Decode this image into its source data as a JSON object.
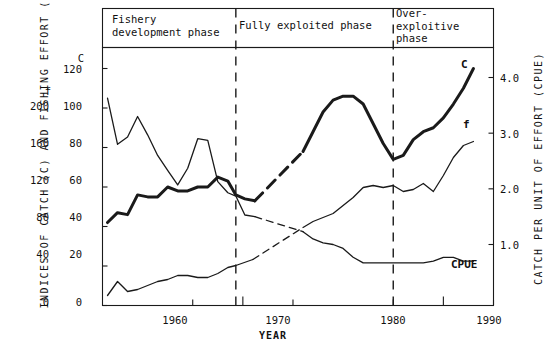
{
  "figure": {
    "y_axis_left_title": "INDICES OF CATCH (C) AND FISHING EFFORT (f)",
    "y_axis_right_title": "CATCH PER UNIT OF EFFORT (CPUE)",
    "x_axis_title": "YEAR"
  },
  "phases": [
    {
      "id": "phase-development",
      "label": "Fishery\ndevelopment phase"
    },
    {
      "id": "phase-fully-exploited",
      "label": "Fully exploited phase"
    },
    {
      "id": "phase-over-exploitive",
      "label": "Over-\nexploitive\nphase"
    }
  ],
  "axis_headers": {
    "c_header": "C",
    "f_header": "f"
  },
  "ticks": {
    "c_scale": [
      "120",
      "100",
      "80",
      "60",
      "40",
      "20",
      "0"
    ],
    "f_scale": [
      "200",
      "160",
      "120",
      "80",
      "40",
      "0"
    ],
    "cpue_scale": [
      "4.0",
      "3.0",
      "2.0",
      "1.0"
    ],
    "years": [
      "1960",
      "1970",
      "1980",
      "1990"
    ]
  },
  "series_keys": {
    "catch": "C",
    "effort": "f",
    "cpue": "CPUE"
  },
  "chart_data": {
    "type": "line",
    "title": "",
    "subtitle": "",
    "xlabel": "YEAR",
    "ylabel": "INDICES OF CATCH (C) AND FISHING EFFORT (f)",
    "ylabel_right": "CATCH PER UNIT OF EFFORT (CPUE)",
    "xlim": [
      1951,
      1990
    ],
    "ylim_c": [
      0,
      130
    ],
    "ylim_f": [
      0,
      216
    ],
    "ylim_cpue": [
      0,
      4.33
    ],
    "grid": false,
    "legend": "inline-end-labels",
    "phase_dividers": [
      1964.3,
      1980
    ],
    "annotations": [
      {
        "text": "Fishery development phase",
        "x_range": [
          1951,
          1964.3
        ]
      },
      {
        "text": "Fully exploited phase",
        "x_range": [
          1964.3,
          1980
        ]
      },
      {
        "text": "Over-exploitive phase",
        "x_range": [
          1980,
          1990
        ]
      }
    ],
    "series": [
      {
        "name": "C",
        "label": "C",
        "style": "thick-solid-with-dashed-gap",
        "axis": "left-c",
        "x": [
          1951.5,
          1952.5,
          1953.5,
          1954.5,
          1955.5,
          1956.5,
          1957.5,
          1958.5,
          1959.5,
          1960.5,
          1961.5,
          1962.5,
          1963.5,
          1964.3,
          1965.2,
          1966.2,
          1971.0,
          1972.0,
          1973.0,
          1974.0,
          1975.0,
          1976.0,
          1977.0,
          1978.0,
          1979.0,
          1980.0,
          1981.0,
          1982.0,
          1983.0,
          1984.0,
          1985.0,
          1986.0,
          1987.0,
          1988.0
        ],
        "values": [
          42,
          47,
          46,
          56,
          55,
          55,
          60,
          58,
          58,
          60,
          60,
          65,
          63,
          56,
          54,
          53,
          78,
          88,
          98,
          104,
          106,
          106,
          102,
          92,
          82,
          74,
          76,
          84,
          88,
          90,
          95,
          102,
          110,
          120
        ],
        "dashed_segment_x": [
          1966.2,
          1971.0
        ]
      },
      {
        "name": "f",
        "label": "f",
        "style": "thin-solid-with-dashed-gap",
        "axis": "left-f",
        "x": [
          1951.5,
          1952.5,
          1953.5,
          1954.5,
          1955.5,
          1956.5,
          1957.5,
          1958.5,
          1959.5,
          1960.5,
          1961.5,
          1962.5,
          1963.5,
          1964.3,
          1966.0,
          1971.0,
          1972.0,
          1973.0,
          1974.0,
          1975.0,
          1976.0,
          1977.0,
          1978.0,
          1979.0,
          1980.0,
          1981.0,
          1982.0,
          1983.0,
          1984.0,
          1985.0,
          1986.0,
          1987.0,
          1988.0
        ],
        "values": [
          10,
          24,
          14,
          16,
          20,
          24,
          26,
          30,
          30,
          28,
          28,
          32,
          38,
          40,
          46,
          78,
          84,
          88,
          92,
          100,
          108,
          118,
          120,
          118,
          120,
          114,
          116,
          122,
          114,
          130,
          148,
          160,
          164
        ],
        "dashed_segment_x": [
          1966.0,
          1971.0
        ]
      },
      {
        "name": "CPUE",
        "label": "CPUE",
        "style": "thin-solid-with-dashed-gap",
        "axis": "right-cpue",
        "x": [
          1951.5,
          1952.5,
          1953.5,
          1954.5,
          1955.5,
          1956.5,
          1957.5,
          1958.5,
          1959.5,
          1960.5,
          1961.5,
          1962.5,
          1963.5,
          1964.3,
          1965.2,
          1966.2,
          1971.0,
          1972.0,
          1973.0,
          1974.0,
          1975.0,
          1976.0,
          1977.0,
          1978.0,
          1979.0,
          1980.0,
          1981.0,
          1982.0,
          1983.0,
          1984.0,
          1985.0,
          1986.0,
          1987.0,
          1988.0
        ],
        "values": [
          3.63,
          2.8,
          2.93,
          3.3,
          2.97,
          2.6,
          2.33,
          2.07,
          2.37,
          2.9,
          2.87,
          2.13,
          1.93,
          1.87,
          1.53,
          1.5,
          1.23,
          1.1,
          1.03,
          1.0,
          0.93,
          0.77,
          0.67,
          0.67,
          0.67,
          0.67,
          0.67,
          0.67,
          0.67,
          0.7,
          0.77,
          0.77,
          0.7,
          0.7
        ],
        "dashed_segment_x": [
          1966.2,
          1971.0
        ]
      }
    ]
  }
}
